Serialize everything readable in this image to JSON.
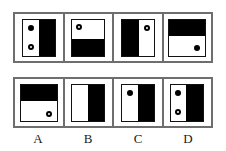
{
  "puzzle": {
    "type": "visual-analogy-matrix",
    "colors": {
      "frame": "#6e6e6e",
      "figure_border": "#111111",
      "fill": "#000000",
      "background": "#ffffff",
      "text": "#1a1a1a"
    },
    "problem_row": {
      "name": "problem-sequence",
      "cells": [
        {
          "id": "problem-1",
          "fill_region": "right",
          "fill_percent": 50,
          "dots": [
            {
              "style": "filled",
              "position": "top-left"
            },
            {
              "style": "open",
              "position": "bottom-left"
            }
          ]
        },
        {
          "id": "problem-2",
          "fill_region": "bottom",
          "fill_percent": 45,
          "dots": [
            {
              "style": "open",
              "position": "top-left"
            }
          ]
        },
        {
          "id": "problem-3",
          "fill_region": "left",
          "fill_percent": 55,
          "dots": [
            {
              "style": "open",
              "position": "top-right"
            }
          ]
        },
        {
          "id": "problem-4",
          "fill_region": "top",
          "fill_percent": 45,
          "dots": [
            {
              "style": "filled",
              "position": "bottom-right"
            }
          ]
        }
      ]
    },
    "options_row": {
      "name": "answer-options",
      "cells": [
        {
          "id": "option-A",
          "label": "A",
          "fill_region": "top",
          "fill_percent": 45,
          "dots": [
            {
              "style": "open",
              "position": "bottom-right"
            }
          ]
        },
        {
          "id": "option-B",
          "label": "B",
          "fill_region": "right",
          "fill_percent": 50,
          "dots": []
        },
        {
          "id": "option-C",
          "label": "C",
          "fill_region": "right",
          "fill_percent": 50,
          "dots": [
            {
              "style": "filled",
              "position": "top-left"
            }
          ]
        },
        {
          "id": "option-D",
          "label": "D",
          "fill_region": "right",
          "fill_percent": 55,
          "dots": [
            {
              "style": "filled",
              "position": "top-left"
            },
            {
              "style": "open",
              "position": "bottom-left"
            }
          ]
        }
      ]
    },
    "labels": [
      "A",
      "B",
      "C",
      "D"
    ]
  }
}
